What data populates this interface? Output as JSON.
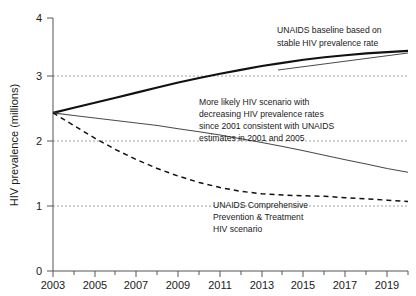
{
  "chart_data": {
    "type": "line",
    "title": "",
    "xlabel": "",
    "ylabel": "HIV prevalence (millions)",
    "xlim": [
      2003,
      2020
    ],
    "ylim": [
      0,
      4
    ],
    "yticks": [
      0,
      1,
      2,
      3,
      4
    ],
    "ytick_labels": [
      "0",
      "1",
      "2",
      "3",
      "4"
    ],
    "xticks": [
      2003,
      2005,
      2007,
      2009,
      2011,
      2013,
      2015,
      2017,
      2019
    ],
    "xtick_labels": [
      "2003",
      "2005",
      "2007",
      "2009",
      "2011",
      "2013",
      "2015",
      "2017",
      "2019"
    ],
    "xminor_ticks": [
      2004,
      2006,
      2008,
      2010,
      2012,
      2014,
      2016,
      2018,
      2020
    ],
    "grid": "horizontal dotted at y=1,2,3",
    "legend": "none (inline annotations)",
    "x": [
      2003,
      2004,
      2005,
      2006,
      2007,
      2008,
      2009,
      2010,
      2011,
      2012,
      2013,
      2014,
      2015,
      2016,
      2017,
      2018,
      2019,
      2020
    ],
    "series": [
      {
        "name": "UNAIDS baseline based on stable HIV prevalence rate",
        "style": "solid-bold",
        "color": "#111111",
        "values": [
          2.5,
          2.58,
          2.66,
          2.74,
          2.82,
          2.9,
          2.98,
          3.05,
          3.12,
          3.18,
          3.24,
          3.29,
          3.34,
          3.38,
          3.41,
          3.44,
          3.46,
          3.48
        ]
      },
      {
        "name": "More likely HIV scenario with decreasing HIV prevalence rates since 2001 consistent with UNAIDS estimates in 2001 and 2005",
        "style": "solid-thin",
        "color": "#4a4a4a",
        "values": [
          2.5,
          2.46,
          2.42,
          2.38,
          2.34,
          2.3,
          2.25,
          2.2,
          2.15,
          2.09,
          2.03,
          1.97,
          1.9,
          1.83,
          1.76,
          1.69,
          1.62,
          1.56
        ]
      },
      {
        "name": "UNAIDS Comprehensive Prevention & Treatment HIV scenario",
        "style": "dashed",
        "color": "#111111",
        "values": [
          2.5,
          2.3,
          2.1,
          1.92,
          1.76,
          1.62,
          1.5,
          1.4,
          1.32,
          1.26,
          1.22,
          1.2,
          1.19,
          1.18,
          1.16,
          1.14,
          1.12,
          1.1
        ]
      }
    ],
    "annotations": [
      {
        "id": "baseline-annotation",
        "lines": [
          "UNAIDS  baseline  based on",
          "stable HIV prevalence rate"
        ]
      },
      {
        "id": "likely-annotation",
        "lines": [
          "More likely HIV scenario with",
          "decreasing HIV prevalence rates",
          "since 2001 consistent with UNAIDS",
          "estimates in 2001 and 2005"
        ]
      },
      {
        "id": "comprehensive-annotation",
        "lines": [
          "UNAIDS Comprehensive",
          "Prevention & Treatment",
          "HIV scenario"
        ]
      }
    ]
  }
}
